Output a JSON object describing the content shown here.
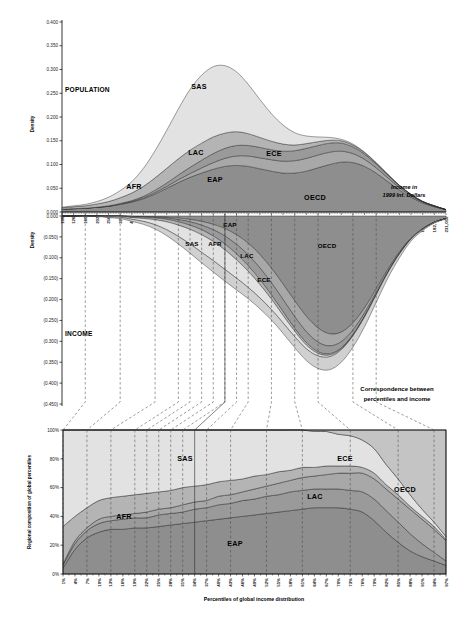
{
  "figure": {
    "notes": {
      "income_units": "Income in\n1999 Int. Dollars",
      "income_units_l1": "Income in",
      "income_units_l2": "1999 Int. Dollars",
      "correspondence_l1": "Correspondence between",
      "correspondence_l2": "percentiles and income"
    }
  },
  "panels": {
    "population": {
      "label": "POPULATION",
      "yaxis_title": "Density",
      "yticks": [
        "0.400",
        "0.350",
        "0.300",
        "0.250",
        "0.200",
        "0.150",
        "0.100",
        "0.050",
        "0.000"
      ],
      "region_labels": [
        "SAS",
        "AFR",
        "LAC",
        "ECE",
        "EAP",
        "OECD"
      ]
    },
    "income": {
      "label": "INCOME",
      "yaxis_title": "Density",
      "yticks": [
        "0.000",
        "(0.050)",
        "(0.100)",
        "(0.150)",
        "(0.200)",
        "(0.250)",
        "(0.300)",
        "(0.350)",
        "(0.400)",
        "(0.450)"
      ],
      "region_labels": [
        "EAP",
        "SAS",
        "AFR",
        "LAC",
        "ECE",
        "OECD"
      ]
    },
    "composition": {
      "yaxis_title": "Regional composition of global percentiles",
      "yticks": [
        "100%",
        "80%",
        "60%",
        "40%",
        "20%",
        "0%"
      ],
      "xaxis_title": "Percentiles of global income distribution",
      "region_labels": [
        "SAS",
        "ECE",
        "OECD",
        "LAC",
        "AFR",
        "EAP"
      ]
    }
  },
  "chart_data": {
    "type": "area",
    "title": "",
    "panels": [
      {
        "id": "population",
        "type": "area",
        "title": "POPULATION",
        "ylabel": "Density",
        "xlabel": "Income in 1999 Int. Dollars",
        "ylim": [
          0.0,
          0.4
        ],
        "yticks": [
          0.0,
          0.05,
          0.1,
          0.15,
          0.2,
          0.25,
          0.3,
          0.35,
          0.4
        ],
        "grid": false,
        "stacking": "stacked",
        "x": [
          "100",
          "126",
          "160",
          "202",
          "256",
          "323",
          "409",
          "517",
          "654",
          "827",
          "1,046",
          "1,323",
          "1,673",
          "2,114",
          "2,674",
          "3,381",
          "4,277",
          "5,407",
          "6,837",
          "8,646",
          "10,934",
          "13,825",
          "17,481",
          "22,106",
          "27,955",
          "35,349",
          "44,700",
          "56,520",
          "71,464",
          "90,363",
          "114,269",
          "144,497",
          "182,706",
          "231,050"
        ],
        "series": [
          {
            "name": "EAP",
            "color": "#8e8e8e",
            "values": [
              0.006,
              0.007,
              0.008,
              0.01,
              0.012,
              0.016,
              0.021,
              0.028,
              0.038,
              0.05,
              0.062,
              0.073,
              0.082,
              0.09,
              0.096,
              0.098,
              0.096,
              0.091,
              0.086,
              0.082,
              0.082,
              0.086,
              0.093,
              0.1,
              0.105,
              0.104,
              0.096,
              0.082,
              0.064,
              0.046,
              0.031,
              0.019,
              0.011,
              0.005
            ]
          },
          {
            "name": "ECE",
            "color": "#a8a8a8",
            "values": [
              0.0,
              0.0,
              0.0,
              0.0,
              0.0,
              0.001,
              0.001,
              0.002,
              0.003,
              0.004,
              0.006,
              0.008,
              0.011,
              0.014,
              0.017,
              0.02,
              0.022,
              0.023,
              0.024,
              0.025,
              0.026,
              0.027,
              0.027,
              0.026,
              0.023,
              0.019,
              0.015,
              0.011,
              0.008,
              0.005,
              0.003,
              0.002,
              0.001,
              0.0
            ]
          },
          {
            "name": "LAC",
            "color": "#9a9a9a",
            "values": [
              0.0,
              0.0,
              0.0,
              0.0,
              0.001,
              0.001,
              0.002,
              0.003,
              0.005,
              0.007,
              0.01,
              0.013,
              0.016,
              0.019,
              0.021,
              0.022,
              0.022,
              0.022,
              0.021,
              0.021,
              0.021,
              0.021,
              0.02,
              0.019,
              0.017,
              0.014,
              0.011,
              0.008,
              0.006,
              0.004,
              0.002,
              0.001,
              0.001,
              0.0
            ]
          },
          {
            "name": "AFR",
            "color": "#b4b4b4",
            "values": [
              0.003,
              0.004,
              0.005,
              0.007,
              0.009,
              0.012,
              0.016,
              0.021,
              0.026,
              0.031,
              0.034,
              0.036,
              0.036,
              0.035,
              0.032,
              0.029,
              0.025,
              0.021,
              0.018,
              0.015,
              0.012,
              0.01,
              0.008,
              0.006,
              0.005,
              0.004,
              0.003,
              0.002,
              0.001,
              0.001,
              0.001,
              0.0,
              0.0,
              0.0
            ]
          },
          {
            "name": "SAS",
            "color": "#e2e2e2",
            "values": [
              0.001,
              0.002,
              0.003,
              0.005,
              0.009,
              0.015,
              0.024,
              0.038,
              0.057,
              0.08,
              0.105,
              0.128,
              0.143,
              0.148,
              0.142,
              0.126,
              0.104,
              0.08,
              0.058,
              0.04,
              0.026,
              0.016,
              0.01,
              0.006,
              0.003,
              0.002,
              0.001,
              0.001,
              0.0,
              0.0,
              0.0,
              0.0,
              0.0,
              0.0
            ]
          }
        ],
        "totals_peak": 0.362
      },
      {
        "id": "income",
        "type": "area",
        "title": "INCOME",
        "ylabel": "Density",
        "ylim": [
          -0.45,
          0.0
        ],
        "yticks": [
          0.0,
          -0.05,
          -0.1,
          -0.15,
          -0.2,
          -0.25,
          -0.3,
          -0.35,
          -0.4,
          -0.45
        ],
        "grid": false,
        "stacking": "stacked-negative",
        "x": [
          "100",
          "126",
          "160",
          "202",
          "256",
          "323",
          "409",
          "517",
          "654",
          "827",
          "1,046",
          "1,323",
          "1,673",
          "2,114",
          "2,674",
          "3,381",
          "4,277",
          "5,407",
          "6,837",
          "8,646",
          "10,934",
          "13,825",
          "17,481",
          "22,106",
          "27,955",
          "35,349",
          "44,700",
          "56,520",
          "71,464",
          "90,363",
          "114,269",
          "144,497",
          "182,706",
          "231,050"
        ],
        "series": [
          {
            "name": "OECD",
            "color": "#8e8e8e",
            "values": [
              0.0,
              0.0,
              0.0,
              0.0,
              0.0,
              0.0,
              0.001,
              0.001,
              0.002,
              0.003,
              0.005,
              0.008,
              0.013,
              0.02,
              0.03,
              0.045,
              0.065,
              0.092,
              0.125,
              0.163,
              0.203,
              0.24,
              0.268,
              0.282,
              0.278,
              0.256,
              0.22,
              0.175,
              0.128,
              0.086,
              0.053,
              0.03,
              0.015,
              0.006
            ]
          },
          {
            "name": "ECE",
            "color": "#a8a8a8",
            "values": [
              0.0,
              0.0,
              0.0,
              0.0,
              0.0,
              0.0,
              0.0,
              0.001,
              0.001,
              0.002,
              0.004,
              0.006,
              0.009,
              0.013,
              0.018,
              0.023,
              0.028,
              0.032,
              0.035,
              0.037,
              0.038,
              0.037,
              0.034,
              0.029,
              0.023,
              0.017,
              0.012,
              0.008,
              0.005,
              0.003,
              0.001,
              0.001,
              0.0,
              0.0
            ]
          },
          {
            "name": "LAC",
            "color": "#9a9a9a",
            "values": [
              0.0,
              0.0,
              0.0,
              0.0,
              0.0,
              0.0,
              0.001,
              0.001,
              0.002,
              0.003,
              0.005,
              0.008,
              0.011,
              0.015,
              0.019,
              0.023,
              0.026,
              0.028,
              0.029,
              0.029,
              0.028,
              0.026,
              0.023,
              0.019,
              0.015,
              0.011,
              0.008,
              0.005,
              0.003,
              0.002,
              0.001,
              0.001,
              0.0,
              0.0
            ]
          },
          {
            "name": "AFR",
            "color": "#b4b4b4",
            "values": [
              0.0,
              0.0,
              0.0,
              0.0,
              0.001,
              0.001,
              0.002,
              0.003,
              0.004,
              0.006,
              0.008,
              0.01,
              0.012,
              0.013,
              0.014,
              0.014,
              0.013,
              0.012,
              0.01,
              0.009,
              0.007,
              0.006,
              0.004,
              0.003,
              0.002,
              0.002,
              0.001,
              0.001,
              0.0,
              0.0,
              0.0,
              0.0,
              0.0,
              0.0
            ]
          },
          {
            "name": "SAS",
            "color": "#e2e2e2",
            "values": [
              0.0,
              0.0,
              0.0,
              0.0,
              0.001,
              0.002,
              0.004,
              0.007,
              0.012,
              0.019,
              0.027,
              0.035,
              0.042,
              0.046,
              0.047,
              0.044,
              0.039,
              0.032,
              0.025,
              0.018,
              0.013,
              0.009,
              0.006,
              0.004,
              0.002,
              0.001,
              0.001,
              0.0,
              0.0,
              0.0,
              0.0,
              0.0,
              0.0,
              0.0
            ]
          },
          {
            "name": "EAP",
            "color": "#d0d0d0",
            "values": [
              0.0,
              0.0,
              0.001,
              0.001,
              0.002,
              0.003,
              0.005,
              0.007,
              0.01,
              0.014,
              0.018,
              0.022,
              0.025,
              0.027,
              0.028,
              0.028,
              0.027,
              0.026,
              0.025,
              0.025,
              0.026,
              0.028,
              0.03,
              0.031,
              0.03,
              0.027,
              0.023,
              0.018,
              0.013,
              0.009,
              0.005,
              0.003,
              0.002,
              0.001
            ]
          }
        ],
        "trough_peak": -0.385
      },
      {
        "id": "composition",
        "type": "area",
        "title": "",
        "ylabel": "Regional composition of global percentiles",
        "xlabel": "Percentiles of global income distribution",
        "ylim": [
          0,
          100
        ],
        "yticks": [
          0,
          20,
          40,
          60,
          80,
          100
        ],
        "grid": false,
        "stacking": "percent",
        "categories": [
          "1%",
          "4%",
          "7%",
          "10%",
          "13%",
          "16%",
          "19%",
          "22%",
          "25%",
          "28%",
          "31%",
          "34%",
          "37%",
          "40%",
          "43%",
          "46%",
          "49%",
          "52%",
          "55%",
          "58%",
          "61%",
          "64%",
          "67%",
          "70%",
          "73%",
          "76%",
          "79%",
          "82%",
          "85%",
          "88%",
          "91%",
          "94%",
          "97%"
        ],
        "series": [
          {
            "name": "EAP",
            "color": "#8e8e8e",
            "values": [
              4,
              17,
              25,
              29,
              31,
              31,
              32,
              32,
              33,
              34,
              35,
              36,
              37,
              38,
              39,
              40,
              41,
              42,
              43,
              44,
              45,
              46,
              46,
              46,
              45,
              43,
              37,
              29,
              22,
              16,
              12,
              9,
              6
            ]
          },
          {
            "name": "LAC",
            "color": "#9a9a9a",
            "values": [
              2,
              4,
              5,
              6,
              6,
              7,
              7,
              7,
              8,
              8,
              8,
              9,
              9,
              10,
              10,
              11,
              11,
              12,
              12,
              13,
              13,
              13,
              13,
              13,
              13,
              14,
              15,
              15,
              14,
              12,
              9,
              6,
              3
            ]
          },
          {
            "name": "ECE",
            "color": "#a8a8a8",
            "values": [
              1,
              2,
              2,
              3,
              3,
              3,
              3,
              4,
              4,
              4,
              5,
              5,
              5,
              6,
              6,
              6,
              7,
              7,
              8,
              8,
              9,
              9,
              10,
              11,
              12,
              13,
              14,
              15,
              16,
              17,
              17,
              16,
              14
            ]
          },
          {
            "name": "AFR",
            "color": "#b4b4b4",
            "values": [
              26,
              17,
              14,
              13,
              13,
              13,
              13,
              13,
              12,
              12,
              12,
              11,
              11,
              10,
              10,
              9,
              9,
              8,
              8,
              7,
              7,
              6,
              6,
              5,
              5,
              4,
              4,
              3,
              3,
              2,
              2,
              2,
              1
            ]
          },
          {
            "name": "SAS",
            "color": "#e2e2e2",
            "values": [
              67,
              60,
              54,
              49,
              47,
              46,
              45,
              44,
              43,
              42,
              40,
              39,
              38,
              36,
              35,
              34,
              32,
              31,
              29,
              28,
              26,
              25,
              24,
              22,
              21,
              19,
              17,
              14,
              11,
              8,
              5,
              3,
              2
            ]
          },
          {
            "name": "OECD",
            "color": "#c4c4c4",
            "values": [
              0,
              0,
              0,
              0,
              0,
              0,
              0,
              0,
              0,
              0,
              0,
              0,
              0,
              0,
              0,
              0,
              0,
              0,
              0,
              0,
              0,
              1,
              1,
              3,
              4,
              7,
              13,
              24,
              34,
              45,
              55,
              64,
              74
            ]
          }
        ]
      }
    ],
    "xlabels_income": [
      "100",
      "126",
      "160",
      "202",
      "256",
      "323",
      "409",
      "517",
      "654",
      "827",
      "1,046",
      "1,323",
      "1,673",
      "2,114",
      "2,674",
      "3,381",
      "4,277",
      "5,407",
      "6,837",
      "8,646",
      "10,934",
      "13,825",
      "17,481",
      "22,106",
      "27,955",
      "35,349",
      "44,700",
      "56,520",
      "71,464",
      "90,363",
      "114,269",
      "144,497",
      "182,706",
      "231,050"
    ],
    "xlabels_percentile": [
      "1%",
      "4%",
      "7%",
      "10%",
      "13%",
      "16%",
      "19%",
      "22%",
      "25%",
      "28%",
      "31%",
      "34%",
      "37%",
      "40%",
      "43%",
      "46%",
      "49%",
      "52%",
      "55%",
      "58%",
      "61%",
      "64%",
      "67%",
      "70%",
      "73%",
      "76%",
      "79%",
      "82%",
      "85%",
      "88%",
      "91%",
      "94%",
      "97%"
    ],
    "legend_regions": [
      "SAS",
      "AFR",
      "LAC",
      "ECE",
      "EAP",
      "OECD"
    ],
    "colors": {
      "SAS": "#e2e2e2",
      "AFR": "#b4b4b4",
      "LAC": "#9a9a9a",
      "ECE": "#a8a8a8",
      "EAP": "#8e8e8e",
      "OECD": "#8e8e8e",
      "outline": "#2b2b2b",
      "dashed": "#4a4a4a",
      "axis": "#000000"
    }
  }
}
